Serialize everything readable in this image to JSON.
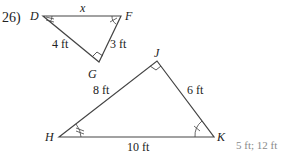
{
  "problem": {
    "number": "26)",
    "answer": "5 ft; 12 ft"
  },
  "small_triangle": {
    "vertices": {
      "D": "D",
      "F": "F",
      "G": "G"
    },
    "sides": {
      "DF": "x",
      "DG": "4 ft",
      "GF": "3 ft"
    },
    "right_angle_at": "G"
  },
  "large_triangle": {
    "vertices": {
      "H": "H",
      "J": "J",
      "K": "K"
    },
    "sides": {
      "HJ": "8 ft",
      "JK": "6 ft",
      "HK": "10 ft"
    },
    "right_angle_at": "J"
  },
  "colors": {
    "line": "#444444",
    "text": "#222222",
    "answer": "#8a8a8a"
  }
}
